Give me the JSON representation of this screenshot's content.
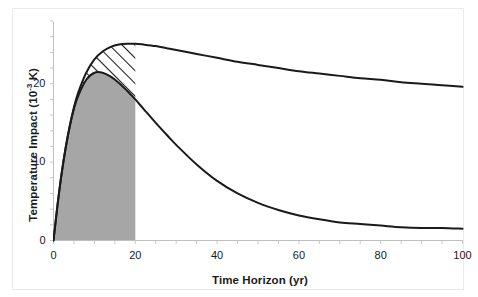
{
  "figure": {
    "background": "#ffffff",
    "frame_color": "#e9eaec"
  },
  "axes": {
    "x_title_prefix": "Time Horizon (yr)",
    "y_title_prefix": "Temperature Impact (10",
    "y_title_exponent": "-3",
    "y_title_suffix": " K)",
    "x_ticks": [
      "0",
      "20",
      "40",
      "60",
      "80",
      "100"
    ],
    "y_ticks": [
      "0",
      "10",
      "20"
    ],
    "x_min": 0,
    "x_max": 100,
    "y_min": 0,
    "y_max": 28,
    "minor_tick_step_x": 5,
    "minor_tick_step_y": 2,
    "axis_color": "#bfbfbf",
    "tick_color": "#c8c8c8"
  },
  "chart_data": {
    "type": "line",
    "title": "",
    "xlabel": "Time Horizon (yr)",
    "ylabel": "Temperature Impact (10^-3 K)",
    "xlim": [
      0,
      100
    ],
    "ylim": [
      0,
      28
    ],
    "grid": false,
    "legend": "none",
    "line_color": "#1a1a1a",
    "line_width": 2.0,
    "series": [
      {
        "name": "sustained-emission temperature impact",
        "role": "upper-curve",
        "x": [
          0,
          1,
          2,
          3,
          4,
          5,
          6,
          8,
          10,
          12,
          14,
          16,
          18,
          20,
          22,
          25,
          28,
          30,
          35,
          40,
          45,
          50,
          55,
          60,
          65,
          70,
          75,
          80,
          85,
          90,
          95,
          100
        ],
        "values": [
          0.0,
          4.6,
          8.6,
          11.9,
          14.7,
          17.0,
          18.8,
          21.4,
          23.1,
          24.1,
          24.7,
          25.0,
          25.1,
          25.1,
          25.0,
          24.8,
          24.5,
          24.3,
          23.8,
          23.3,
          22.8,
          22.4,
          22.0,
          21.6,
          21.3,
          21.0,
          20.7,
          20.5,
          20.2,
          20.0,
          19.8,
          19.6
        ]
      },
      {
        "name": "pulse-emission temperature impact",
        "role": "lower-curve",
        "x": [
          0,
          1,
          2,
          3,
          4,
          5,
          6,
          8,
          10,
          12,
          14,
          16,
          18,
          20,
          22,
          25,
          28,
          30,
          35,
          40,
          45,
          50,
          55,
          60,
          65,
          70,
          75,
          80,
          85,
          90,
          95,
          100
        ],
        "values": [
          0.0,
          4.6,
          8.6,
          11.9,
          14.6,
          16.8,
          18.4,
          20.5,
          21.4,
          21.4,
          20.9,
          20.1,
          19.1,
          18.0,
          16.8,
          15.0,
          13.3,
          12.2,
          9.7,
          7.6,
          6.0,
          4.8,
          3.9,
          3.2,
          2.7,
          2.3,
          2.1,
          1.9,
          1.7,
          1.6,
          1.6,
          1.5
        ]
      }
    ],
    "regions": [
      {
        "name": "gray-filled-region",
        "fill": "#a6a6a6",
        "fill_style": "solid",
        "x_range": [
          0,
          20
        ],
        "description": "area under lower curve from 0 to 20 yr"
      },
      {
        "name": "hatched-region",
        "fill": "#ffffff",
        "fill_style": "diagonal-hatch",
        "hatch_color": "#1a1a1a",
        "x_range": [
          0,
          20
        ],
        "description": "area between lower and upper curve from 0 to 20 yr"
      }
    ]
  }
}
